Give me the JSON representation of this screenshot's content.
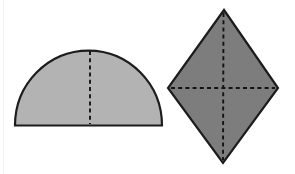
{
  "figure": {
    "canvas": {
      "width": 295,
      "height": 174,
      "background": "#ffffff"
    },
    "colors": {
      "semicircle_fill": "#b3b3b3",
      "rhombus_fill": "#7d7d7d",
      "outline": "#1c1c1c",
      "dash": "#141414"
    },
    "stroke_width": 2.2,
    "dash_width": 1.9,
    "dash_pattern": "4 3.2",
    "shapes": [
      {
        "id": "semicircle",
        "type": "semicircle",
        "fill_key": "semicircle_fill",
        "baseline": {
          "x1": 15,
          "x2": 162,
          "y": 125.5
        },
        "rx": 73.5,
        "ry": 75,
        "dashed_lines": [
          {
            "x1": 90,
            "y1": 51,
            "x2": 90,
            "y2": 124
          }
        ]
      },
      {
        "id": "rhombus",
        "type": "polygon",
        "fill_key": "rhombus_fill",
        "points": [
          [
            224,
            10
          ],
          [
            278,
            88
          ],
          [
            223,
            163
          ],
          [
            168,
            88
          ]
        ],
        "dashed_lines": [
          {
            "x1": 223.5,
            "y1": 13,
            "x2": 223,
            "y2": 160
          },
          {
            "x1": 171,
            "y1": 88,
            "x2": 275,
            "y2": 88
          }
        ]
      }
    ]
  }
}
